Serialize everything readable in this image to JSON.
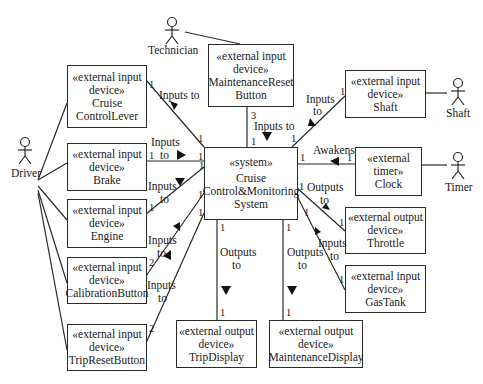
{
  "diagram": {
    "type": "UML context diagram",
    "system": {
      "stereotype": "«system»",
      "name_lines": [
        "Cruise",
        "Control&Monitoring",
        "System"
      ]
    },
    "actors": [
      {
        "id": "technician",
        "name": "Technician"
      },
      {
        "id": "driver",
        "name": "Driver"
      },
      {
        "id": "shaft",
        "name": "Shaft"
      },
      {
        "id": "timer",
        "name": "Timer"
      }
    ],
    "blocks": {
      "cruise_control_lever": {
        "stereo1": "«external input",
        "stereo2": "device»",
        "name1": "Cruise",
        "name2": "ControlLever"
      },
      "maintenance_reset_button": {
        "stereo1": "«external input",
        "stereo2": "device»",
        "name1": "MaintenanceReset",
        "name2": "Button"
      },
      "shaft": {
        "stereo1": "«external input",
        "stereo2": "device»",
        "name1": "Shaft"
      },
      "brake": {
        "stereo1": "«external input",
        "stereo2": "device»",
        "name1": "Brake"
      },
      "clock": {
        "stereo1": "«external",
        "stereo2": "timer»",
        "name1": "Clock"
      },
      "engine": {
        "stereo1": "«external input",
        "stereo2": "device»",
        "name1": "Engine"
      },
      "throttle": {
        "stereo1": "«external output",
        "stereo2": "device»",
        "name1": "Throttle"
      },
      "calibration_button": {
        "stereo1": "«external input",
        "stereo2": "device»",
        "name1": "CalibrationButton"
      },
      "gas_tank": {
        "stereo1": "«external input",
        "stereo2": "device»",
        "name1": "GasTank"
      },
      "trip_reset_button": {
        "stereo1": "«external input",
        "stereo2": "device»",
        "name1": "TripResetButton"
      },
      "trip_display": {
        "stereo1": "«external output",
        "stereo2": "device»",
        "name1": "TripDisplay"
      },
      "maintenance_display": {
        "stereo1": "«external output",
        "stereo2": "device»",
        "name1": "MaintenanceDisplay"
      }
    },
    "association_labels": {
      "cruise_lever": "Inputs to",
      "maint_reset": "Inputs to",
      "shaft_1": "Inputs",
      "shaft_2": "to",
      "brake_1": "Inputs",
      "brake_2": "to",
      "clock": "Awakens",
      "engine_1": "Inputs",
      "engine_2": "to",
      "throttle_1": "Outputs",
      "throttle_2": "to",
      "calib_1": "Inputs",
      "calib_2": "to",
      "gastank_1": "Inputs",
      "gastank_2": "to",
      "tripdisp_1": "Outputs",
      "tripdisp_2": "to",
      "maintdisp_1": "Outputs",
      "maintdisp_2": "to"
    },
    "multiplicities": {
      "one": "1",
      "two": "2",
      "three": "3"
    }
  }
}
